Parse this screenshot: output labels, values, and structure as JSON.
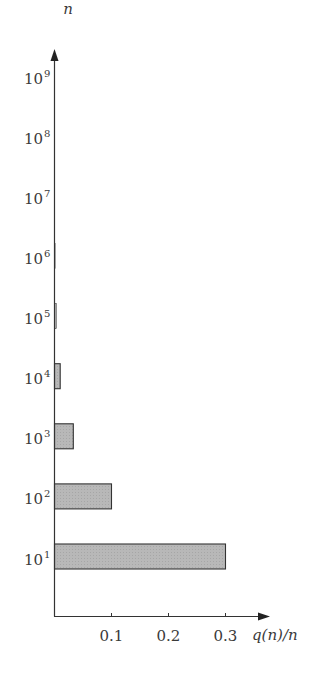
{
  "chart_data": {
    "type": "bar",
    "orientation": "horizontal",
    "title": "",
    "xlabel": "q(n)/n",
    "ylabel": "n",
    "categories": [
      "10^1",
      "10^2",
      "10^3",
      "10^4",
      "10^5",
      "10^6",
      "10^7",
      "10^8",
      "10^9"
    ],
    "category_labels": [
      {
        "base": "10",
        "exp": "1"
      },
      {
        "base": "10",
        "exp": "2"
      },
      {
        "base": "10",
        "exp": "3"
      },
      {
        "base": "10",
        "exp": "4"
      },
      {
        "base": "10",
        "exp": "5"
      },
      {
        "base": "10",
        "exp": "6"
      },
      {
        "base": "10",
        "exp": "7"
      },
      {
        "base": "10",
        "exp": "8"
      },
      {
        "base": "10",
        "exp": "9"
      }
    ],
    "values": [
      0.3,
      0.1,
      0.033,
      0.01,
      0.003,
      0.001,
      0.0003,
      0.0001,
      3e-05
    ],
    "xticks": [
      "0.1",
      "0.2",
      "0.3"
    ],
    "xtick_values": [
      0.1,
      0.2,
      0.3
    ],
    "xlim": [
      0,
      0.375
    ],
    "grid": false,
    "legend": null,
    "bar_fill": "#b4b4b4",
    "bar_stroke": "#333333",
    "axis_color": "#333333"
  }
}
